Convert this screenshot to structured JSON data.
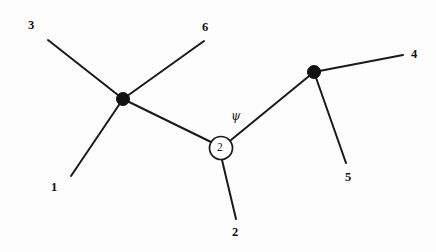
{
  "figure": {
    "type": "graph-diagram",
    "background_color": "#fdfdfd",
    "line_color": "#1a1a1a"
  },
  "vertices": [
    {
      "id": "left-vertex",
      "style": "filled-dot",
      "x": 123,
      "y": 99,
      "radius": 6.5,
      "color": "#111111"
    },
    {
      "id": "center-vertex",
      "style": "open-circle",
      "x": 221,
      "y": 148,
      "radius": 11.5,
      "fill": "#ffffff",
      "stroke": "#1a1a1a",
      "inner_label": "2"
    },
    {
      "id": "right-vertex",
      "style": "filled-dot",
      "x": 314,
      "y": 72,
      "radius": 6.5,
      "color": "#111111"
    }
  ],
  "edges": [
    {
      "id": "edge-1",
      "from": "leg-1",
      "to": "left-vertex",
      "x1": 71,
      "y1": 176,
      "x2": 123,
      "y2": 99
    },
    {
      "id": "edge-3",
      "from": "leg-3",
      "to": "left-vertex",
      "x1": 48,
      "y1": 40,
      "x2": 123,
      "y2": 99
    },
    {
      "id": "edge-6",
      "from": "left-vertex",
      "to": "leg-6",
      "x1": 123,
      "y1": 99,
      "x2": 204,
      "y2": 41
    },
    {
      "id": "edge-internal-left",
      "from": "left-vertex",
      "to": "center-vertex",
      "x1": 123,
      "y1": 99,
      "x2": 211,
      "y2": 142
    },
    {
      "id": "edge-2",
      "from": "center-vertex",
      "to": "leg-2",
      "x1": 222,
      "y1": 160,
      "x2": 236,
      "y2": 219
    },
    {
      "id": "edge-internal-right",
      "from": "center-vertex",
      "to": "right-vertex",
      "x1": 231,
      "y1": 140,
      "x2": 314,
      "y2": 72
    },
    {
      "id": "edge-4",
      "from": "right-vertex",
      "to": "leg-4",
      "x1": 314,
      "y1": 72,
      "x2": 403,
      "y2": 55
    },
    {
      "id": "edge-5",
      "from": "right-vertex",
      "to": "leg-5",
      "x1": 314,
      "y1": 72,
      "x2": 346,
      "y2": 163
    }
  ],
  "labels": {
    "leg_1": "1",
    "leg_2": "2",
    "leg_3": "3",
    "leg_4": "4",
    "leg_5": "5",
    "leg_6": "6",
    "center_node": "2",
    "psi": "ψ"
  },
  "label_positions": [
    {
      "name": "leg-label-3",
      "text": "3",
      "x": 28,
      "y": 19
    },
    {
      "name": "leg-label-6",
      "text": "6",
      "x": 202,
      "y": 21
    },
    {
      "name": "leg-label-4",
      "text": "4",
      "x": 411,
      "y": 48
    },
    {
      "name": "leg-label-1",
      "text": "1",
      "x": 51,
      "y": 181
    },
    {
      "name": "leg-label-5",
      "text": "5",
      "x": 345,
      "y": 171
    },
    {
      "name": "leg-label-2",
      "text": "2",
      "x": 232,
      "y": 226
    },
    {
      "name": "psi-label",
      "text": "ψ",
      "x": 231,
      "y": 110
    }
  ]
}
